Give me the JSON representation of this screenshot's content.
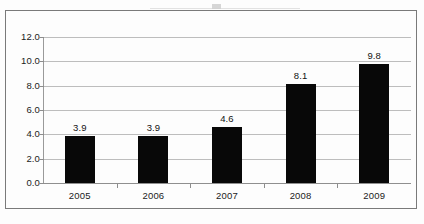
{
  "chart_data": {
    "type": "bar",
    "title": "",
    "subtitle": "",
    "xlabel": "",
    "ylabel": "",
    "categories": [
      "2005",
      "2006",
      "2007",
      "2008",
      "2009"
    ],
    "values": [
      3.9,
      3.9,
      4.6,
      8.1,
      9.8
    ],
    "value_labels": [
      "3.9",
      "3.9",
      "4.6",
      "8.1",
      "9.8"
    ],
    "ylim": [
      0.0,
      12.0
    ],
    "ytick_step": 2.0,
    "ytick_labels": [
      "12.0",
      "10.0",
      "8.0",
      "6.0",
      "4.0",
      "2.0",
      "0.0"
    ],
    "ytick_values": [
      12.0,
      10.0,
      8.0,
      6.0,
      4.0,
      2.0,
      0.0
    ],
    "grid": true,
    "grid_axis": "y",
    "legend": false,
    "legend_position": "none",
    "bar_color": "#080808",
    "grid_color": "#bdbdbd",
    "axis_color": "#8f8f8f",
    "frame_color": "#7a7a7a",
    "background_color": "#fdfdfd",
    "data_labels_shown": true
  }
}
